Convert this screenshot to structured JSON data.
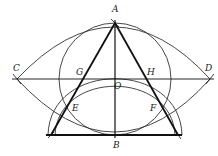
{
  "diagram": {
    "type": "geometric-construction",
    "labels": {
      "A": "A",
      "B": "B",
      "C": "C",
      "D": "D",
      "E": "E",
      "F": "F",
      "G": "G",
      "H": "H",
      "O": "O"
    },
    "stroke_color": "#222222"
  }
}
